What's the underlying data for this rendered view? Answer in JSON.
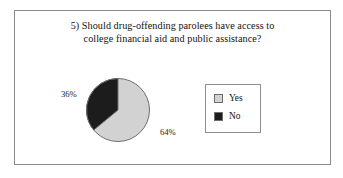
{
  "figure": {
    "border_color": "#8a8a8a",
    "background": "#ffffff"
  },
  "title": {
    "line1": "5) Should drug-offending parolees have access to",
    "line2": "college financial aid and public assistance?"
  },
  "legend": {
    "items": [
      {
        "label": "Yes",
        "color": "#d2d2d2",
        "swatch_name": "legend-swatch-yes"
      },
      {
        "label": "No",
        "color": "#1c1c1c",
        "swatch_name": "legend-swatch-no"
      }
    ]
  },
  "labels": {
    "yes_pct": "64%",
    "no_pct": "36%"
  },
  "chart_data": {
    "type": "pie",
    "title": "5) Should drug-offending parolees have access to college financial aid and public assistance?",
    "categories": [
      "Yes",
      "No"
    ],
    "values": [
      64,
      36
    ],
    "value_labels": [
      "64%",
      "36%"
    ],
    "colors": [
      "#d2d2d2",
      "#1c1c1c"
    ],
    "units": "percent",
    "start_angle_deg": 0,
    "direction": "clockwise",
    "legend": "right",
    "grid": false,
    "xlabel": "",
    "ylabel": ""
  }
}
